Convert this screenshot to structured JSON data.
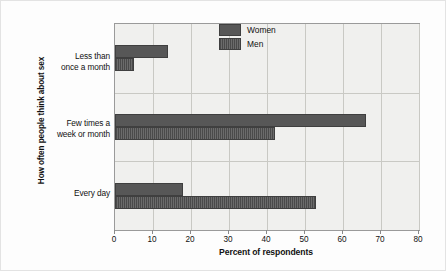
{
  "chart_data": {
    "type": "bar",
    "orientation": "horizontal",
    "title": "",
    "xlabel": "Percent of respondents",
    "ylabel": "How often people think about sex",
    "xlim": [
      0,
      80
    ],
    "xticks": [
      0,
      10,
      20,
      30,
      40,
      50,
      60,
      70,
      80
    ],
    "grid": true,
    "legend_position": "top-right",
    "categories": [
      "Less than once a month",
      "Few times a week or month",
      "Every day"
    ],
    "category_lines": [
      [
        "Less than",
        "once a month"
      ],
      [
        "Few times a",
        "week or month"
      ],
      [
        "Every day",
        ""
      ]
    ],
    "series": [
      {
        "name": "Women",
        "values": [
          14,
          66,
          18
        ],
        "color": "#575757"
      },
      {
        "name": "Men",
        "values": [
          5,
          42,
          53
        ],
        "color": "#5d5d5d"
      }
    ]
  },
  "legend": {
    "items": [
      {
        "label": "Women"
      },
      {
        "label": "Men"
      }
    ]
  },
  "axis": {
    "x_title": "Percent of respondents",
    "y_title": "How often people think about sex",
    "tick_labels": [
      "0",
      "10",
      "20",
      "30",
      "40",
      "50",
      "60",
      "70",
      "80"
    ]
  },
  "colors": {
    "women": "#575757",
    "men": "#5d5d5d",
    "plot_background": "#f0f0ee",
    "gridline": "#c9c9c4",
    "frame": "#9a9a9a",
    "page_background": "#fdfdfd"
  }
}
